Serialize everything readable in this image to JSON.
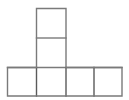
{
  "figure": {
    "name": "polyomino-net-diagram",
    "type": "grid-net",
    "canvas": {
      "width": 129,
      "height": 100,
      "background": "#ffffff"
    },
    "style": {
      "stroke": "#7a7a7a",
      "stroke_dark": "#5a5a5a",
      "stroke_width": 1.4,
      "fill": "#ffffff"
    },
    "grid": {
      "cell_width": 29.5,
      "cell_height": 29.5,
      "columns": 4,
      "rows": 3
    },
    "cells": [
      {
        "id": "cell-top",
        "label": "",
        "col": 1,
        "row": 0,
        "x": 36.5,
        "y": 8.5,
        "w": 29.5,
        "h": 29.5
      },
      {
        "id": "cell-middle",
        "label": "",
        "col": 1,
        "row": 1,
        "x": 36.5,
        "y": 38.0,
        "w": 29.5,
        "h": 29.5
      },
      {
        "id": "cell-bottom-1",
        "label": "",
        "col": 0,
        "row": 2,
        "x": 7.5,
        "y": 67.5,
        "w": 29.0,
        "h": 28.5
      },
      {
        "id": "cell-bottom-2",
        "label": "",
        "col": 1,
        "row": 2,
        "x": 36.5,
        "y": 67.5,
        "w": 29.5,
        "h": 28.5
      },
      {
        "id": "cell-bottom-3",
        "label": "",
        "col": 2,
        "row": 2,
        "x": 66.0,
        "y": 67.5,
        "w": 28.0,
        "h": 28.5
      },
      {
        "id": "cell-bottom-4",
        "label": "",
        "col": 3,
        "row": 2,
        "x": 94.0,
        "y": 67.5,
        "w": 28.0,
        "h": 28.5
      }
    ],
    "outline_path": "M 36.5 8.5 L 66.0 8.5 L 66.0 67.5 L 122.0 67.5 L 122.0 96.0 L 7.5 96.0 L 7.5 67.5 L 36.5 67.5 Z",
    "internal_lines": [
      {
        "id": "divider-top-middle",
        "x1": 36.5,
        "y1": 38.0,
        "x2": 66.0,
        "y2": 38.0,
        "orientation": "horizontal"
      },
      {
        "id": "divider-middle-row",
        "x1": 7.5,
        "y1": 67.5,
        "x2": 122.0,
        "y2": 67.5,
        "orientation": "horizontal"
      },
      {
        "id": "divider-bottom-1-2",
        "x1": 36.5,
        "y1": 67.5,
        "x2": 36.5,
        "y2": 96.0,
        "orientation": "vertical"
      },
      {
        "id": "divider-bottom-2-3",
        "x1": 66.0,
        "y1": 67.5,
        "x2": 66.0,
        "y2": 96.0,
        "orientation": "vertical"
      },
      {
        "id": "divider-bottom-3-4",
        "x1": 94.0,
        "y1": 67.5,
        "x2": 94.0,
        "y2": 96.0,
        "orientation": "vertical"
      }
    ],
    "counts": {
      "total_squares": 6,
      "bottom_row_squares": 4,
      "column_squares": 2
    },
    "caption": ""
  }
}
